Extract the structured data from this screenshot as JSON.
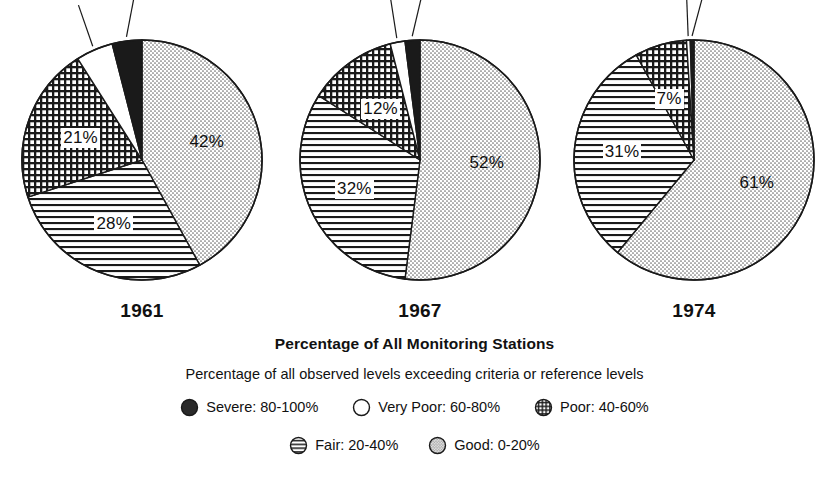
{
  "figure": {
    "main_caption": "Percentage of All Monitoring Stations",
    "sub_caption": "Percentage of all observed levels exceeding criteria or reference levels"
  },
  "legend": {
    "rows": [
      [
        {
          "key": "severe",
          "label": "Severe: 80-100%",
          "pattern": "solid-black",
          "swatch_name": "legend-swatch-severe"
        },
        {
          "key": "very_poor",
          "label": "Very Poor: 60-80%",
          "pattern": "white",
          "swatch_name": "legend-swatch-very-poor"
        },
        {
          "key": "poor",
          "label": "Poor: 40-60%",
          "pattern": "grid",
          "swatch_name": "legend-swatch-poor"
        }
      ],
      [
        {
          "key": "fair",
          "label": "Fair: 20-40%",
          "pattern": "hlines",
          "swatch_name": "legend-swatch-fair"
        },
        {
          "key": "good",
          "label": "Good: 0-20%",
          "pattern": "dots",
          "swatch_name": "legend-swatch-good"
        }
      ]
    ]
  },
  "chart_data": {
    "type": "pie",
    "title": "Percentage of All Monitoring Stations",
    "subtitle": "Percentage of all observed levels exceeding criteria or reference levels",
    "categories": [
      "Good: 0-20%",
      "Fair: 20-40%",
      "Poor: 40-60%",
      "Very Poor: 60-80%",
      "Severe: 80-100%"
    ],
    "legend_position": "bottom",
    "charts": [
      {
        "year": "1961",
        "slices": [
          {
            "key": "good",
            "label": "42%",
            "value": 42,
            "pattern": "dots",
            "label_pos": "inside"
          },
          {
            "key": "fair",
            "label": "28%",
            "value": 28,
            "pattern": "hlines",
            "label_pos": "inside"
          },
          {
            "key": "poor",
            "label": "21%",
            "value": 21,
            "pattern": "grid",
            "label_pos": "inside"
          },
          {
            "key": "very_poor",
            "label": "5%",
            "value": 5,
            "pattern": "white",
            "label_pos": "outside"
          },
          {
            "key": "severe",
            "label": "4%",
            "value": 4,
            "pattern": "solid-black",
            "label_pos": "outside"
          }
        ]
      },
      {
        "year": "1967",
        "slices": [
          {
            "key": "good",
            "label": "52%",
            "value": 52,
            "pattern": "dots",
            "label_pos": "inside"
          },
          {
            "key": "fair",
            "label": "32%",
            "value": 32,
            "pattern": "hlines",
            "label_pos": "inside"
          },
          {
            "key": "poor",
            "label": "12%",
            "value": 12,
            "pattern": "grid",
            "label_pos": "inside"
          },
          {
            "key": "very_poor",
            "label": "2%",
            "value": 2,
            "pattern": "white",
            "label_pos": "outside"
          },
          {
            "key": "severe",
            "label": "2%",
            "value": 2,
            "pattern": "solid-black",
            "label_pos": "outside"
          }
        ]
      },
      {
        "year": "1974",
        "slices": [
          {
            "key": "good",
            "label": "61%",
            "value": 61,
            "pattern": "dots",
            "label_pos": "inside"
          },
          {
            "key": "fair",
            "label": "31%",
            "value": 31,
            "pattern": "hlines",
            "label_pos": "inside"
          },
          {
            "key": "poor",
            "label": "7%",
            "value": 7,
            "pattern": "grid",
            "label_pos": "inside"
          },
          {
            "key": "very_poor",
            "label": ".5%",
            "value": 0.5,
            "pattern": "white",
            "label_pos": "outside"
          },
          {
            "key": "severe",
            "label": ".5%",
            "value": 0.5,
            "pattern": "solid-black",
            "label_pos": "outside"
          }
        ]
      }
    ]
  }
}
